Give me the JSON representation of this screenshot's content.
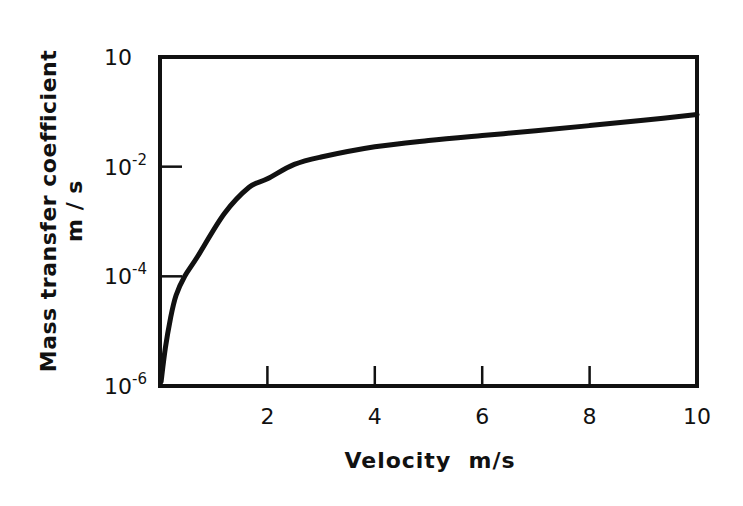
{
  "chart_data": {
    "type": "line",
    "title": "",
    "xlabel": "Velocity  m/s",
    "ylabel": "Mass transfer coefficient",
    "ylabel_unit": "m / s",
    "xlim": [
      0,
      10
    ],
    "ylim": [
      1e-06,
      1
    ],
    "yscale": "log",
    "grid": false,
    "legend": null,
    "x_ticks": [
      2,
      4,
      6,
      8,
      10
    ],
    "x_tick_labels": [
      "2",
      "4",
      "6",
      "8",
      "10"
    ],
    "y_ticks": [
      1e-06,
      0.0001,
      0.01,
      1
    ],
    "y_tick_labels": [
      {
        "base": "10",
        "exp": "-6"
      },
      {
        "base": "10",
        "exp": "-4"
      },
      {
        "base": "10",
        "exp": "-2"
      },
      {
        "base": "10",
        "exp": ""
      }
    ],
    "series": [
      {
        "name": "mass transfer coefficient",
        "x": [
          0.02,
          0.1,
          0.2,
          0.3,
          0.46,
          0.7,
          1.2,
          1.66,
          2.0,
          2.5,
          3.0,
          4.0,
          5.0,
          6.0,
          7.0,
          8.0,
          9.0,
          10.0
        ],
        "y": [
          1.2e-06,
          5e-06,
          1.8e-05,
          4.5e-05,
          0.0001,
          0.00023,
          0.0014,
          0.0042,
          0.006,
          0.011,
          0.015,
          0.023,
          0.03,
          0.037,
          0.045,
          0.056,
          0.07,
          0.089
        ]
      }
    ]
  },
  "labels": {
    "xlabel": "Velocity  m/s",
    "ylabel_line1": "Mass transfer coefficient",
    "ylabel_line2": "m / s"
  }
}
